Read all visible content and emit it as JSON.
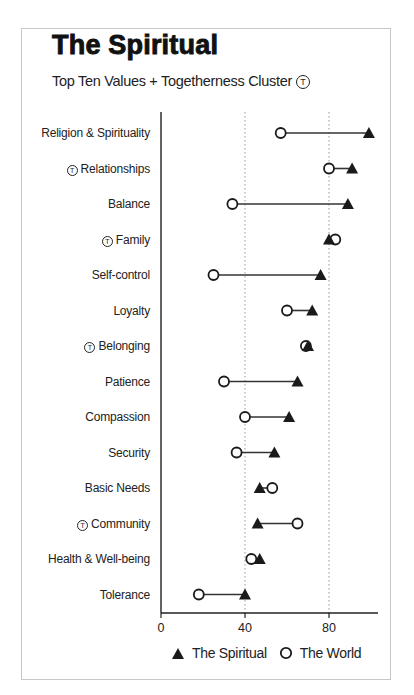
{
  "chart_data": {
    "type": "dumbbell",
    "title": "The Spiritual",
    "subtitle": "Top Ten Values + Togetherness Cluster",
    "subtitle_marker": "T",
    "xlabel": "",
    "ylabel": "",
    "xlim": [
      0,
      104
    ],
    "xticks": [
      "0",
      "40",
      "80"
    ],
    "grid": "vertical dotted at 40 and 80",
    "legend_position": "bottom",
    "categories": [
      {
        "label": "Religion & Spirituality",
        "togetherness": false
      },
      {
        "label": "Relationships",
        "togetherness": true
      },
      {
        "label": "Balance",
        "togetherness": false
      },
      {
        "label": "Family",
        "togetherness": true
      },
      {
        "label": "Self-control",
        "togetherness": false
      },
      {
        "label": "Loyalty",
        "togetherness": false
      },
      {
        "label": "Belonging",
        "togetherness": true
      },
      {
        "label": "Patience",
        "togetherness": false
      },
      {
        "label": "Compassion",
        "togetherness": false
      },
      {
        "label": "Security",
        "togetherness": false
      },
      {
        "label": "Basic Needs",
        "togetherness": false
      },
      {
        "label": "Community",
        "togetherness": true
      },
      {
        "label": "Health & Well-being",
        "togetherness": false
      },
      {
        "label": "Tolerance",
        "togetherness": false
      }
    ],
    "series": [
      {
        "name": "The Spiritual",
        "marker": "filled-triangle",
        "values": [
          99,
          91,
          89,
          80,
          76,
          72,
          70,
          65,
          61,
          54,
          47,
          46,
          47,
          40
        ]
      },
      {
        "name": "The World",
        "marker": "open-circle",
        "values": [
          57,
          80,
          34,
          83,
          25,
          60,
          69,
          30,
          40,
          36,
          53,
          65,
          43,
          18
        ]
      }
    ]
  },
  "legend": {
    "spiritual": "The Spiritual",
    "world": "The World"
  },
  "ticks": {
    "t0": "0",
    "t40": "40",
    "t80": "80"
  }
}
